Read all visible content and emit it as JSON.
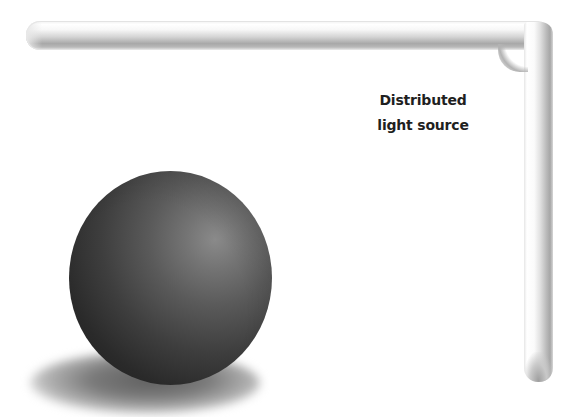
{
  "diagram": {
    "label": {
      "lines": [
        "Distributed",
        "light source"
      ]
    },
    "elements": {
      "light_source": "L-shaped tube light along top and right edges",
      "object": "shaded sphere",
      "shadow": "soft cast shadow beneath sphere"
    },
    "colors": {
      "background": "#ffffff",
      "sphere_dark": "#1e1e1e",
      "sphere_highlight": "#8a8a8a",
      "tube_shade": "#a8a8a8",
      "label_text": "#1f1f1f"
    }
  }
}
